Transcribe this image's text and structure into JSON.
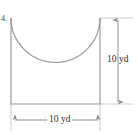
{
  "figure": {
    "kind": "geometry-diagram",
    "corner_mark": "4.",
    "stroke_color": "#9a9a9a",
    "guide_color": "#c8c8c8",
    "text_color": "#2b2b2b",
    "background_color": "#ffffff"
  },
  "shape": {
    "name": "u-shaped-region",
    "left_edge_x": 11,
    "right_edge_x": 100,
    "top_y": 18,
    "bottom_y": 104,
    "arc": {
      "type": "semicircle",
      "start": [
        11,
        18
      ],
      "end": [
        100,
        18
      ],
      "lowest_y": 63,
      "concave": "up"
    }
  },
  "dimensions": {
    "vertical": {
      "label": "10 yd",
      "value": 10,
      "unit": "yd",
      "line_x": 118,
      "top_y": 18,
      "bottom_y": 104,
      "arrow_top": true,
      "arrow_bottom": true
    },
    "horizontal": {
      "label": "10 yd",
      "value": 10,
      "unit": "yd",
      "line_y": 120,
      "left_x": 13,
      "right_x": 100,
      "arrow_left": true,
      "arrow_right": true
    }
  }
}
